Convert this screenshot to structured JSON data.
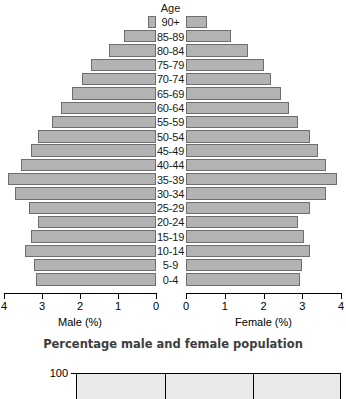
{
  "chart_data": {
    "type": "bar",
    "subtype": "population-pyramid",
    "title": "",
    "caption": "Percentage male and female population",
    "categories": [
      "0-4",
      "5-9",
      "10-14",
      "15-19",
      "20-24",
      "25-29",
      "30-34",
      "35-39",
      "40-44",
      "45-49",
      "50-54",
      "55-59",
      "60-64",
      "65-69",
      "70-74",
      "75-79",
      "80-84",
      "85-89",
      "90+"
    ],
    "category_axis_label": "Age",
    "xlim": [
      0,
      4
    ],
    "xticks": [
      0,
      1,
      2,
      3,
      4
    ],
    "grid": false,
    "legend": "none",
    "series": [
      {
        "name": "Male (%)",
        "axis_label": "Male (%)",
        "direction": "left",
        "values": [
          3.15,
          3.2,
          3.45,
          3.3,
          3.1,
          3.35,
          3.7,
          3.9,
          3.55,
          3.3,
          3.1,
          2.75,
          2.5,
          2.2,
          1.95,
          1.7,
          1.25,
          0.85,
          0.2
        ]
      },
      {
        "name": "Female (%)",
        "axis_label": "Female (%)",
        "direction": "right",
        "values": [
          2.95,
          3.0,
          3.2,
          3.05,
          2.9,
          3.2,
          3.6,
          3.9,
          3.6,
          3.4,
          3.2,
          2.9,
          2.65,
          2.45,
          2.2,
          2.0,
          1.6,
          1.15,
          0.55
        ]
      }
    ],
    "bar_color": "#b3b3b3",
    "bar_border_color": "#6e6e6e"
  },
  "axis": {
    "age_header": "Age",
    "male_title": "Male (%)",
    "female_title": "Female (%)",
    "male_ticklabels": [
      "4",
      "3",
      "2",
      "1",
      "0"
    ],
    "female_ticklabels": [
      "0",
      "1",
      "2",
      "3",
      "4"
    ]
  },
  "caption": {
    "text": "Percentage male and female population"
  },
  "next_chart": {
    "ylabel_top": "100"
  }
}
